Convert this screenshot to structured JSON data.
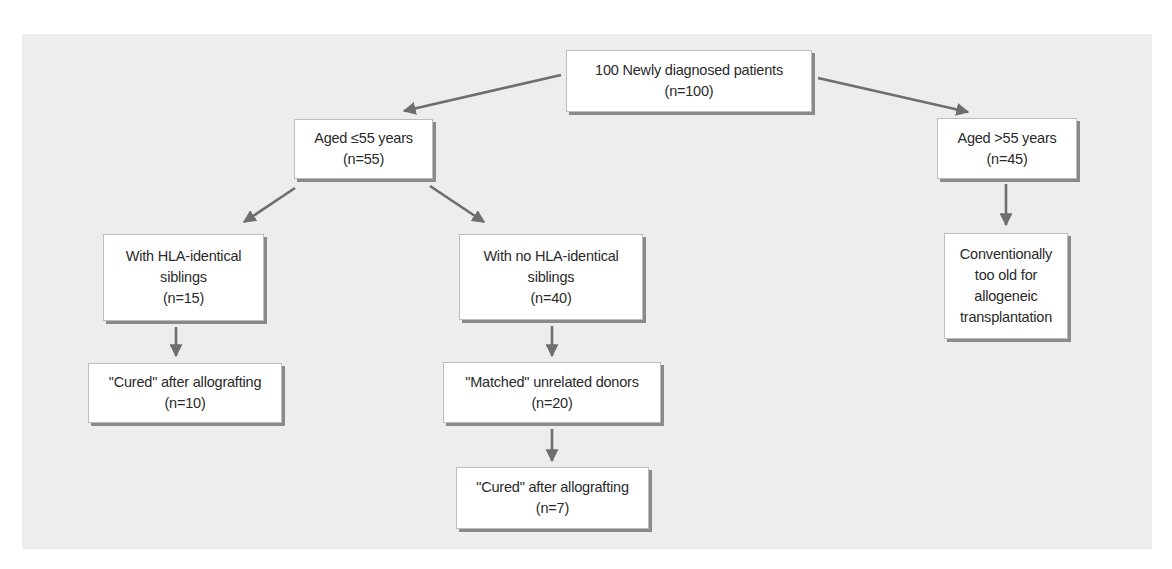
{
  "diagram": {
    "type": "flowchart",
    "colors": {
      "panel_background": "#ededed",
      "box_fill": "#ffffff",
      "box_shadow": "#8a8a8a",
      "arrow": "#6e6e6e",
      "text": "#2a2a2a"
    },
    "nodes": {
      "root": {
        "lines": [
          "100 Newly diagnosed patients",
          "(n=100)"
        ]
      },
      "aged_le55": {
        "lines": [
          "Aged ≤55 years",
          "(n=55)"
        ]
      },
      "aged_gt55": {
        "lines": [
          "Aged >55 years",
          "(n=45)"
        ]
      },
      "with_hla": {
        "lines": [
          "With HLA-identical",
          "siblings",
          "(n=15)"
        ]
      },
      "no_hla": {
        "lines": [
          "With no HLA-identical",
          "siblings",
          "(n=40)"
        ]
      },
      "too_old": {
        "lines": [
          "Conventionally",
          "too old for",
          "allogeneic",
          "transplantation"
        ]
      },
      "cured_sibling": {
        "lines": [
          "\"Cured\" after allografting",
          "(n=10)"
        ]
      },
      "matched_unrelated": {
        "lines": [
          "\"Matched\" unrelated donors",
          "(n=20)"
        ]
      },
      "cured_unrelated": {
        "lines": [
          "\"Cured\" after allografting",
          "(n=7)"
        ]
      }
    },
    "edges": [
      {
        "from": "root",
        "to": "aged_le55"
      },
      {
        "from": "root",
        "to": "aged_gt55"
      },
      {
        "from": "aged_le55",
        "to": "with_hla"
      },
      {
        "from": "aged_le55",
        "to": "no_hla"
      },
      {
        "from": "aged_gt55",
        "to": "too_old"
      },
      {
        "from": "with_hla",
        "to": "cured_sibling"
      },
      {
        "from": "no_hla",
        "to": "matched_unrelated"
      },
      {
        "from": "matched_unrelated",
        "to": "cured_unrelated"
      }
    ]
  }
}
